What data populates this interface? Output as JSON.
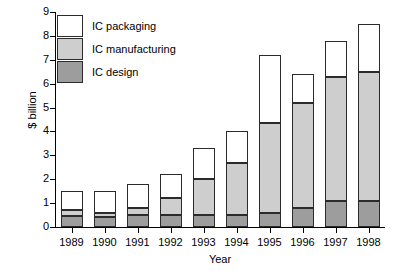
{
  "chart_data": {
    "type": "bar",
    "subtype": "stacked",
    "title": "",
    "xlabel": "Year",
    "ylabel": "$ billion",
    "categories": [
      "1989",
      "1990",
      "1991",
      "1992",
      "1993",
      "1994",
      "1995",
      "1996",
      "1997",
      "1998"
    ],
    "series": [
      {
        "name": "IC design",
        "color": "#9d9d9d",
        "values": [
          0.45,
          0.4,
          0.5,
          0.5,
          0.5,
          0.5,
          0.6,
          0.8,
          1.1,
          1.1
        ]
      },
      {
        "name": "IC manufacturing",
        "color": "#cecece",
        "values": [
          0.25,
          0.2,
          0.3,
          0.7,
          1.5,
          2.2,
          3.75,
          4.4,
          5.2,
          5.4
        ]
      },
      {
        "name": "IC packaging",
        "color": "#ffffff",
        "values": [
          0.8,
          0.9,
          1.0,
          1.0,
          1.3,
          1.3,
          2.85,
          1.2,
          1.5,
          2.0
        ]
      }
    ],
    "totals": [
      1.5,
      1.5,
      1.8,
      2.2,
      3.3,
      4.0,
      7.2,
      6.4,
      7.8,
      8.5
    ],
    "ylim": [
      0,
      9
    ],
    "yticks": [
      "0",
      "1",
      "2",
      "3",
      "4",
      "5",
      "6",
      "7",
      "8",
      "9"
    ],
    "grid": false,
    "legend_position": "top-left",
    "legend": [
      "IC packaging",
      "IC manufacturing",
      "IC design"
    ]
  }
}
